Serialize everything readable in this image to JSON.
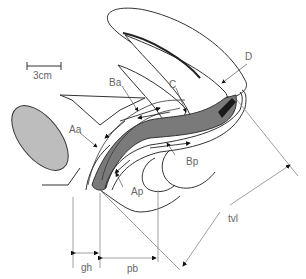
{
  "diagram": {
    "type": "anatomical-sagittal-section",
    "scale_bar": {
      "label": "3cm"
    },
    "points": [
      {
        "id": "Aa",
        "label": "Aa"
      },
      {
        "id": "Ba",
        "label": "Ba"
      },
      {
        "id": "C",
        "label": "C"
      },
      {
        "id": "D",
        "label": "D"
      },
      {
        "id": "Ap",
        "label": "Ap"
      },
      {
        "id": "Bp",
        "label": "Bp"
      }
    ],
    "measurements": [
      {
        "id": "gh",
        "label": "gh"
      },
      {
        "id": "pb",
        "label": "pb"
      },
      {
        "id": "tvl",
        "label": "tvl"
      }
    ],
    "colors": {
      "line": "#333333",
      "label": "#666666",
      "vaginal_wall": "#7a7a7a",
      "cervix_dark": "#1a1a1a",
      "pubic_bone": "#bdbdbd",
      "dimension_line": "#888888"
    }
  }
}
